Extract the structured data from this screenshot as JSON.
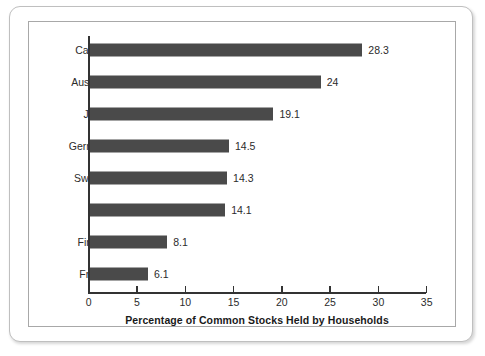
{
  "chart_data": {
    "type": "bar",
    "orientation": "horizontal",
    "title": "",
    "xlabel": "Percentage of Common Stocks Held by Households",
    "ylabel": "",
    "xlim": [
      0,
      35
    ],
    "xticks": [
      0,
      5,
      10,
      15,
      20,
      25,
      30,
      35
    ],
    "xtick_labels": [
      "0",
      "5",
      "10",
      "15",
      "20",
      "25",
      "30",
      "35"
    ],
    "grid": false,
    "legend": false,
    "bar_color": "#4a4a4a",
    "axis_color": "#333333",
    "categories": [
      "Canada",
      "Australia",
      "Japan",
      "Germany",
      "Sweden",
      "U.K.",
      "Finland",
      "France"
    ],
    "values": [
      28.3,
      24,
      19.1,
      14.5,
      14.3,
      14.1,
      8.1,
      6.1
    ],
    "value_labels": [
      "28.3",
      "24",
      "19.1",
      "14.5",
      "14.3",
      "14.1",
      "8.1",
      "6.1"
    ],
    "points": [
      {
        "category": "Canada",
        "value": 28.3,
        "label": "28.3"
      },
      {
        "category": "Australia",
        "value": 24,
        "label": "24"
      },
      {
        "category": "Japan",
        "value": 19.1,
        "label": "19.1"
      },
      {
        "category": "Germany",
        "value": 14.5,
        "label": "14.5"
      },
      {
        "category": "Sweden",
        "value": 14.3,
        "label": "14.3"
      },
      {
        "category": "U.K.",
        "value": 14.1,
        "label": "14.1"
      },
      {
        "category": "Finland",
        "value": 8.1,
        "label": "8.1"
      },
      {
        "category": "France",
        "value": 6.1,
        "label": "6.1"
      }
    ]
  }
}
